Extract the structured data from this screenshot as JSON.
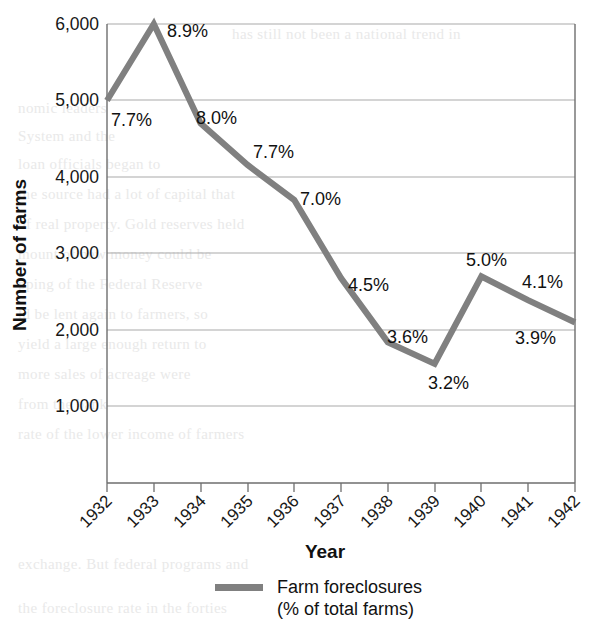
{
  "chart_data": {
    "type": "line",
    "title": "",
    "xlabel": "Year",
    "ylabel": "Number of farms",
    "categories": [
      "1932",
      "1933",
      "1934",
      "1935",
      "1936",
      "1937",
      "1938",
      "1939",
      "1940",
      "1941",
      "1942"
    ],
    "values": [
      5000,
      6000,
      4700,
      4160,
      3700,
      2680,
      1840,
      1560,
      2700,
      2390,
      2100
    ],
    "point_labels": [
      "7.7%",
      "8.9%",
      "8.0%",
      "7.7%",
      "7.0%",
      "4.5%",
      "3.6%",
      "3.2%",
      "5.0%",
      "4.1%",
      "3.9%"
    ],
    "ylim": [
      0,
      6000
    ],
    "ytick_labels": [
      "6,000",
      "5,000",
      "4,000",
      "3,000",
      "2,000",
      "1,000"
    ],
    "ytick_values": [
      6000,
      5000,
      4000,
      3000,
      2000,
      1000
    ],
    "grid": "horizontal",
    "legend_position": "bottom-center",
    "series": [
      {
        "name": "Farm foreclosures (% of total farms)",
        "name_line1": "Farm foreclosures",
        "name_line2": "(% of total farms)",
        "color": "#808080",
        "values": [
          5000,
          6000,
          4700,
          4160,
          3700,
          2680,
          1840,
          1560,
          2700,
          2390,
          2100
        ]
      }
    ]
  },
  "axes": {
    "x_title": "Year",
    "y_title": "Number of farms"
  },
  "legend": {
    "swatch_color": "#808080",
    "label_line1": "Farm foreclosures",
    "label_line2": "(% of total farms)"
  },
  "colors": {
    "series": "#808080",
    "grid": "#a9a9a9",
    "axis": "#6e6e6e",
    "text": "#111111",
    "background": "#ffffff"
  },
  "background_text": [
    "has still not been a national trend in",
    "nomic leaders",
    "System and the",
    "loan officials began to",
    "the source had a lot of capital that",
    "of real property. Gold reserves held",
    "mount of new money could be",
    "pping of the Federal Reserve",
    "ld be lent again to farmers, so",
    "yield a large enough return to",
    "more sales of acreage were",
    "from the bank",
    "rate of the lower income of farmers",
    "exchange. But federal programs and",
    "the foreclosure rate in the forties"
  ]
}
